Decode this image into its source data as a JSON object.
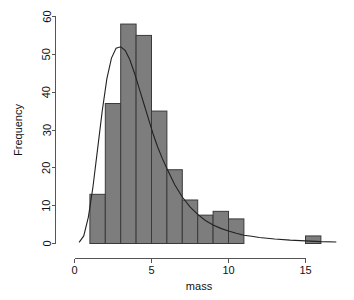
{
  "chart_data": {
    "type": "bar",
    "title": "",
    "subtitle": "",
    "xlabel": "mass",
    "ylabel": "Frequency",
    "xlim": [
      -0.4,
      18.0
    ],
    "ylim": [
      0,
      61
    ],
    "grid": false,
    "legend": false,
    "legend_position": "none",
    "bin_width": 1,
    "bin_edges": [
      0,
      1,
      2,
      3,
      4,
      5,
      6,
      7,
      8,
      9,
      10,
      11,
      12,
      13,
      14,
      15,
      16,
      17
    ],
    "categories": [
      "0-1",
      "1-2",
      "2-3",
      "3-4",
      "4-5",
      "5-6",
      "6-7",
      "7-8",
      "8-9",
      "9-10",
      "10-11",
      "11-12",
      "12-13",
      "13-14",
      "14-15",
      "15-16",
      "16-17"
    ],
    "values": [
      0,
      13,
      37,
      58,
      55,
      35,
      19.5,
      11.5,
      7.5,
      8.5,
      6.5,
      0,
      0,
      0,
      0,
      2,
      0
    ],
    "bar_color": "#7d7d7d",
    "bar_edge_color": "#3a3a3a",
    "xticks": [
      0,
      5,
      10,
      15
    ],
    "xticklabels": [
      "0",
      "5",
      "10",
      "15"
    ],
    "yticks": [
      0,
      10,
      20,
      30,
      40,
      50,
      60
    ],
    "yticklabels": [
      "0",
      "10",
      "20",
      "30",
      "40",
      "50",
      "60"
    ],
    "overlay": {
      "name": "fitted density curve",
      "type": "line",
      "color": "#222222",
      "peak_x": 2.9,
      "peak_y": 52,
      "x": [
        0.3,
        0.6,
        0.9,
        1.2,
        1.5,
        1.8,
        2.1,
        2.4,
        2.7,
        3.0,
        3.3,
        3.6,
        3.9,
        4.2,
        4.5,
        4.8,
        5.1,
        5.4,
        5.7,
        6.0,
        6.5,
        7.0,
        7.5,
        8.0,
        8.5,
        9.0,
        9.5,
        10.0,
        10.5,
        11.0,
        11.5,
        12.0,
        13.0,
        14.0,
        15.0,
        16.0,
        17.0
      ],
      "y": [
        0.3,
        2.0,
        7.0,
        15.0,
        25.0,
        35.0,
        43.5,
        49.0,
        51.6,
        52.0,
        51.0,
        48.5,
        45.0,
        41.0,
        37.0,
        33.0,
        29.0,
        25.5,
        22.5,
        19.8,
        15.6,
        12.3,
        9.7,
        7.7,
        6.1,
        4.9,
        4.0,
        3.3,
        2.7,
        2.2,
        1.9,
        1.6,
        1.2,
        0.9,
        0.7,
        0.5,
        0.4
      ]
    }
  },
  "axes": {
    "x_axis_name": "mass",
    "y_axis_name": "Frequency"
  }
}
